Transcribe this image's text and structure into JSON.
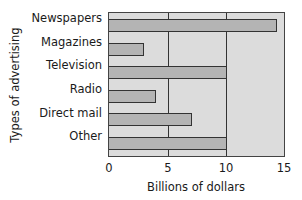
{
  "chart_data": {
    "type": "bar",
    "orientation": "horizontal",
    "title": "",
    "categories": [
      "Newspapers",
      "Magazines",
      "Television",
      "Radio",
      "Direct mail",
      "Other"
    ],
    "values": [
      14.2,
      3,
      10,
      4,
      7,
      10
    ],
    "xlabel": "Billions of dollars",
    "ylabel": "Types of advertising",
    "xlim": [
      0,
      15
    ],
    "xticks": [
      "0",
      "5",
      "10",
      "15"
    ],
    "grid": true,
    "legend": null
  }
}
